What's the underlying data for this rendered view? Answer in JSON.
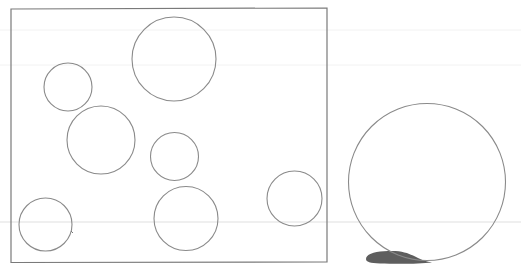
{
  "diagram": {
    "colors": {
      "background": "#ffffff",
      "frame_stroke": "#7a7a7a",
      "circle_stroke": "#8a8a8a",
      "shadow_fill": "#5e5e5e",
      "scanline": "#dcdcdc"
    },
    "frame": {
      "label": "",
      "contained_circle_count": 7
    },
    "circles_inside_frame": [
      {
        "id": "top-center-large",
        "relative_size": "large"
      },
      {
        "id": "upper-left-small",
        "relative_size": "small"
      },
      {
        "id": "mid-left-medium",
        "relative_size": "medium"
      },
      {
        "id": "center-small",
        "relative_size": "small"
      },
      {
        "id": "bottom-center-medium",
        "relative_size": "medium"
      },
      {
        "id": "bottom-left-small",
        "relative_size": "small"
      },
      {
        "id": "right-small",
        "relative_size": "small"
      }
    ],
    "circles_outside_frame": [
      {
        "id": "outer-right-large",
        "relative_size": "extra-large",
        "has_shadow": true
      }
    ],
    "annotations": [
      {
        "id": "tick-mark",
        "text": ""
      }
    ]
  }
}
